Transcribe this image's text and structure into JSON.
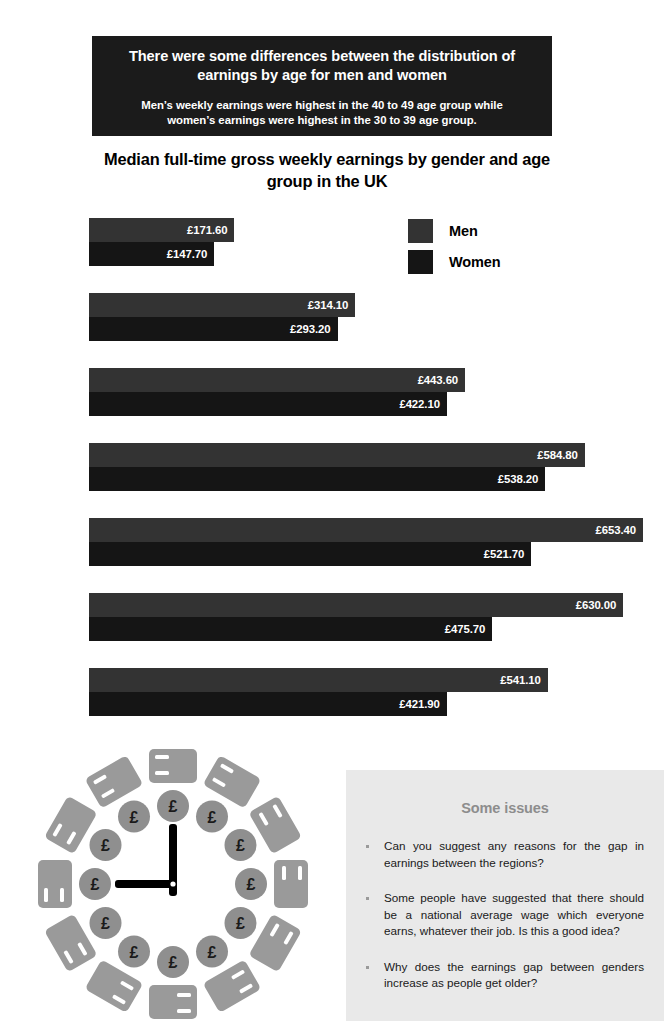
{
  "header": {
    "main_text": "There were some differences between the distribution of earnings by age for men and women",
    "sub_text": "Men’s weekly earnings were highest in the 40 to 49 age group while women’s earnings were highest  in the 30 to 39 age group.",
    "background_color": "#1b1b1b",
    "text_color": "#ffffff"
  },
  "chart_title": "Median full-time gross weekly earnings by gender and age group in the UK",
  "legend": {
    "items": [
      {
        "label": "Men",
        "color": "#333333"
      },
      {
        "label": "Women",
        "color": "#151515"
      }
    ]
  },
  "chart_data": {
    "type": "bar",
    "orientation": "horizontal",
    "title": "Median full-time gross weekly earnings by gender and age group in the UK",
    "xlabel": "",
    "ylabel": "",
    "grid": false,
    "legend_position": "top-right",
    "xlim": [
      0,
      653.4
    ],
    "categories": [
      "16 to 17",
      "18 to 21",
      "22 to 29",
      "30 to 39",
      "40 to 49",
      "50 to 59",
      "60 and over"
    ],
    "series": [
      {
        "name": "Men",
        "color": "#333333",
        "values": [
          171.6,
          314.1,
          443.6,
          584.8,
          653.4,
          630.0,
          541.1
        ],
        "labels": [
          "£171.60",
          "£314.10",
          "£443.60",
          "£584.80",
          "£653.40",
          "£630.00",
          "£541.10"
        ]
      },
      {
        "name": "Women",
        "color": "#151515",
        "values": [
          147.7,
          293.2,
          422.1,
          538.2,
          521.7,
          475.7,
          421.9
        ],
        "labels": [
          "£147.70",
          "£293.20",
          "£422.10",
          "£538.20",
          "£521.70",
          "£475.70",
          "£421.90"
        ]
      }
    ],
    "units": "GBP per week",
    "value_label_position": "inside-end"
  },
  "issues": {
    "title": "Some issues",
    "background_color": "#e9e9e9",
    "title_color": "#8d8d8d",
    "bullets": [
      "Can you suggest any reasons for the gap in earnings between the regions?",
      "Some people have suggested that there should be a national average wage which everyone earns, whatever their job. Is this a good idea?",
      "Why does the earnings gap between genders increase as people get older?"
    ]
  },
  "illustration": {
    "name": "clock-with-money-illustration",
    "coin_symbol": "£",
    "coin_count": 12,
    "banknote_count": 12,
    "hand_color": "#000000",
    "note_color": "#9a9a9a",
    "coin_color": "#8f8f8f"
  }
}
